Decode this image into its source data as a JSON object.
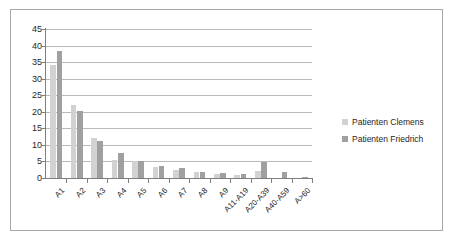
{
  "chart_data": {
    "type": "bar",
    "title": "",
    "subtitle": "",
    "xlabel": "",
    "ylabel": "",
    "ylim": [
      0,
      45
    ],
    "yticks": [
      0,
      5,
      10,
      15,
      20,
      25,
      30,
      35,
      40,
      45
    ],
    "grid": true,
    "legend_position": "right",
    "categories": [
      "A1",
      "A2",
      "A3",
      "A4",
      "A5",
      "A6",
      "A7",
      "A8",
      "A9",
      "A11-A19",
      "A20-A39",
      "A40-A59",
      "A>60"
    ],
    "series": [
      {
        "name": "Patienten Clemens",
        "color": "#d2d2d2",
        "values": [
          34,
          22,
          12,
          5.3,
          5,
          3.4,
          2.4,
          1.7,
          1.2,
          0.9,
          2.2,
          0,
          0
        ]
      },
      {
        "name": "Patienten Friedrich",
        "color": "#a0a0a0",
        "values": [
          38.3,
          20.2,
          11.3,
          7.7,
          5,
          3.5,
          2.9,
          1.9,
          1.6,
          1.2,
          4.7,
          1.7,
          0.4
        ]
      }
    ]
  },
  "legend": {
    "entries": [
      {
        "label": "Patienten Clemens",
        "marker": "square-swatch-light"
      },
      {
        "label": "Patienten Friedrich",
        "marker": "square-swatch-dark"
      }
    ]
  },
  "axes": {
    "y_tick_labels": [
      "0",
      "5",
      "10",
      "15",
      "20",
      "25",
      "30",
      "35",
      "40",
      "45"
    ],
    "x_tick_labels": [
      "A1",
      "A2",
      "A3",
      "A4",
      "A5",
      "A6",
      "A7",
      "A8",
      "A9",
      "A11-A19",
      "A20-A39",
      "A40-A59",
      "A>60"
    ]
  },
  "colors": {
    "series_clemens": "#d2d2d2",
    "series_friedrich": "#a0a0a0",
    "gridline": "#b9b9b9",
    "axis": "#7f7f7f",
    "border": "#a8a8a8",
    "text": "#262626",
    "background": "#ffffff"
  }
}
